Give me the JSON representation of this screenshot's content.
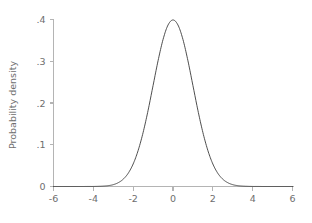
{
  "chart_data": {
    "type": "line",
    "title": "",
    "subtitle": "",
    "xlabel": "",
    "ylabel": "Probability density",
    "xlim": [
      -6,
      6
    ],
    "ylim": [
      0,
      0.4
    ],
    "grid": false,
    "legend": null,
    "x_ticks": [
      -6,
      -4,
      -2,
      0,
      2,
      4,
      6
    ],
    "x_tick_labels": [
      "-6",
      "-4",
      "-2",
      "0",
      "2",
      "4",
      "6"
    ],
    "y_ticks": [
      0,
      0.1,
      0.2,
      0.3,
      0.4
    ],
    "y_tick_labels": [
      "0",
      ".1",
      ".2",
      ".3",
      ".4"
    ],
    "series": [
      {
        "name": "standard normal density",
        "color": "#3a3a3a",
        "x": [
          -6,
          -5.75,
          -5.5,
          -5.25,
          -5,
          -4.75,
          -4.5,
          -4.25,
          -4,
          -3.75,
          -3.5,
          -3.25,
          -3,
          -2.75,
          -2.5,
          -2.25,
          -2,
          -1.75,
          -1.5,
          -1.25,
          -1,
          -0.75,
          -0.5,
          -0.25,
          0,
          0.25,
          0.5,
          0.75,
          1,
          1.25,
          1.5,
          1.75,
          2,
          2.25,
          2.5,
          2.75,
          3,
          3.25,
          3.5,
          3.75,
          4,
          4.25,
          4.5,
          4.75,
          5,
          5.25,
          5.5,
          5.75,
          6
        ],
        "y": [
          0.0,
          0.0,
          0.0,
          0.0,
          0.0,
          0.0,
          0.0,
          0.0001,
          0.0001,
          0.0004,
          0.0009,
          0.002,
          0.0044,
          0.0091,
          0.0175,
          0.0317,
          0.054,
          0.0863,
          0.1295,
          0.1826,
          0.242,
          0.3011,
          0.3521,
          0.3867,
          0.3989,
          0.3867,
          0.3521,
          0.3011,
          0.242,
          0.1826,
          0.1295,
          0.0863,
          0.054,
          0.0317,
          0.0175,
          0.0091,
          0.0044,
          0.002,
          0.0009,
          0.0004,
          0.0001,
          0.0001,
          0.0,
          0.0,
          0.0,
          0.0,
          0.0,
          0.0,
          0.0
        ]
      }
    ],
    "peak": {
      "x": 0,
      "y": 0.3989
    }
  },
  "axes": {
    "y_title": "Probability density",
    "x_title": ""
  },
  "colors": {
    "background": "#ffffff",
    "axis": "#b4b4b4",
    "tick_text": "#6e6e6e",
    "curve": "#3a3a3a"
  }
}
